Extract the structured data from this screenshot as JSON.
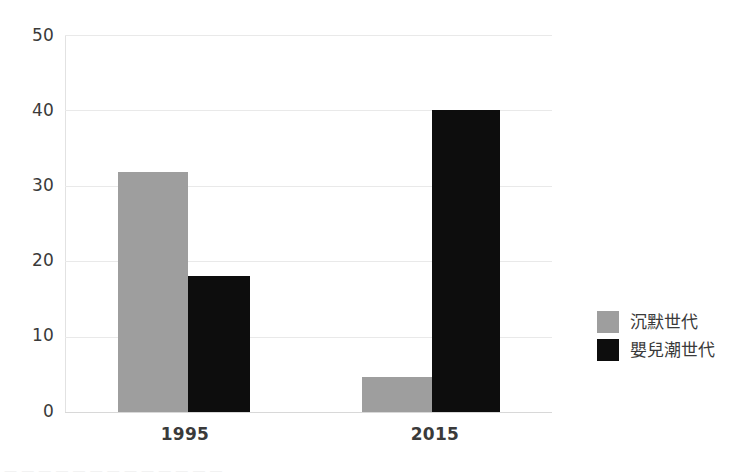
{
  "chart_data": {
    "type": "bar",
    "title": "",
    "subtitle": "",
    "xlabel": "",
    "ylabel": "",
    "categories": [
      "1995",
      "2015"
    ],
    "series": [
      {
        "name": "沉默世代",
        "color": "#9e9e9e",
        "values": [
          31.8,
          4.7
        ]
      },
      {
        "name": "嬰兒潮世代",
        "color": "#0d0d0d",
        "values": [
          18.0,
          40.0
        ]
      }
    ],
    "ylim": [
      0,
      50
    ],
    "y_ticks": [
      0,
      10,
      20,
      30,
      40,
      50
    ],
    "y_tick_labels": [
      "0",
      "10",
      "20",
      "30",
      "40",
      "50"
    ],
    "grid": true,
    "grid_axis": "y",
    "legend_position": "right"
  },
  "legend": {
    "items": [
      {
        "label": "沉默世代",
        "color": "#9e9e9e",
        "swatch": "legend-swatch-silent"
      },
      {
        "label": "嬰兒潮世代",
        "color": "#0d0d0d",
        "swatch": "legend-swatch-boomer"
      }
    ]
  },
  "axis": {
    "y_labels": [
      "50",
      "40",
      "30",
      "20",
      "10",
      "0"
    ],
    "x_labels": [
      "1995",
      "2015"
    ]
  },
  "colors": {
    "silent_generation": "#9e9e9e",
    "baby_boomer": "#0d0d0d",
    "gridline": "#e9e9e9",
    "baseline": "#d8d8d8",
    "text": "#3a3a3a",
    "background": "#ffffff"
  },
  "footer": {
    "clipped_text": "— — — —  — — — — —     — —      —            —"
  }
}
